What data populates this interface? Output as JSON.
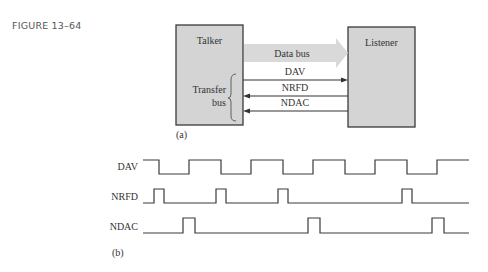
{
  "figure": {
    "label": "FIGURE 13–64"
  },
  "block_diagram": {
    "panel_label": "(a)",
    "talker_label": "Talker",
    "listener_label": "Listener",
    "data_bus_label": "Data bus",
    "transfer_bus_label_line1": "Transfer",
    "transfer_bus_label_line2": "bus",
    "signals": [
      {
        "name": "DAV",
        "direction": "talker-to-listener"
      },
      {
        "name": "NRFD",
        "direction": "listener-to-talker"
      },
      {
        "name": "NDAC",
        "direction": "listener-to-talker"
      }
    ],
    "colors": {
      "box_fill": "#d4d4d4",
      "box_border": "#3a3a3a",
      "data_bus_fill": "#d9d9d9",
      "line": "#333333"
    }
  },
  "timing_diagram": {
    "panel_label": "(b)",
    "signals": [
      {
        "name": "DAV"
      },
      {
        "name": "NRFD"
      },
      {
        "name": "NDAC"
      }
    ]
  }
}
